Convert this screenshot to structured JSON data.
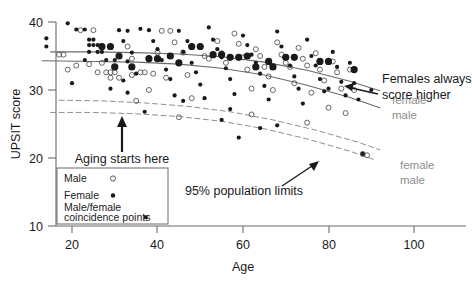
{
  "figure": {
    "background": "#ffffff",
    "axis_color": "#6b6b6b",
    "point_color": "#1a1a1a",
    "curve_color": "#6b6b6b",
    "label_gray": "#8e8e8e"
  },
  "axes": {
    "x": {
      "label": "Age",
      "ticks": [
        20,
        40,
        60,
        80,
        100
      ],
      "tick_labels": [
        "20",
        "40",
        "60",
        "80",
        "100"
      ],
      "min": 10,
      "max": 104
    },
    "y": {
      "label": "UPSIT score",
      "ticks": [
        10,
        20,
        30,
        40
      ],
      "tick_labels": [
        "10",
        "20",
        "30",
        "40"
      ],
      "min": 9,
      "max": 41
    }
  },
  "annotations": [
    {
      "name": "females-higher",
      "lines": [
        "Females always",
        "score higher"
      ]
    },
    {
      "name": "aging-starts",
      "lines": [
        "Aging starts here"
      ]
    },
    {
      "name": "population-limits",
      "lines": [
        "95% population limits"
      ]
    }
  ],
  "curve_labels": [
    {
      "name": "regression-female",
      "text": "female"
    },
    {
      "name": "regression-male",
      "text": "male"
    },
    {
      "name": "limit-female",
      "text": "female"
    },
    {
      "name": "limit-male",
      "text": "male"
    }
  ],
  "legend": {
    "items": [
      {
        "label": "Male",
        "marker": "open-circle"
      },
      {
        "label": "Female",
        "marker": "filled-dot"
      },
      {
        "label": "Male/female",
        "label2": "coincidence points",
        "marker": "small-square"
      }
    ]
  },
  "chart_data": {
    "type": "scatter",
    "title": "",
    "xlabel": "Age",
    "ylabel": "UPSIT score",
    "xlim": [
      10,
      104
    ],
    "ylim": [
      9,
      41
    ],
    "grid": false,
    "legend_position": "lower-left",
    "series": [
      {
        "name": "Male",
        "marker": "open-circle",
        "points": [
          [
            17,
            35.2
          ],
          [
            18,
            35.2
          ],
          [
            22,
            38.8
          ],
          [
            25,
            38.8
          ],
          [
            26,
            32.6
          ],
          [
            28,
            32.6
          ],
          [
            29,
            32.6
          ],
          [
            30,
            32.6
          ],
          [
            29,
            31.8
          ],
          [
            31,
            31.8
          ],
          [
            33,
            36.4
          ],
          [
            34,
            34.6
          ],
          [
            36,
            32.6
          ],
          [
            37,
            32.6
          ],
          [
            38,
            30.0
          ],
          [
            40,
            35.5
          ],
          [
            41,
            38.7
          ],
          [
            43,
            38.7
          ],
          [
            44,
            37.0
          ],
          [
            46,
            35.5
          ],
          [
            47,
            32.2
          ],
          [
            48,
            28.8
          ],
          [
            50,
            36.4
          ],
          [
            51,
            35.0
          ],
          [
            52,
            34.6
          ],
          [
            54,
            37.2
          ],
          [
            55,
            35.4
          ],
          [
            56,
            34.0
          ],
          [
            58,
            38.3
          ],
          [
            59,
            36.8
          ],
          [
            60,
            34.8
          ],
          [
            61,
            33.0
          ],
          [
            62,
            30.2
          ],
          [
            63,
            36.0
          ],
          [
            64,
            35.0
          ],
          [
            65,
            33.4
          ],
          [
            66,
            32.0
          ],
          [
            67,
            30.0
          ],
          [
            68,
            37.0
          ],
          [
            69,
            35.2
          ],
          [
            70,
            34.0
          ],
          [
            71,
            33.4
          ],
          [
            72,
            31.0
          ],
          [
            73,
            36.2
          ],
          [
            74,
            34.6
          ],
          [
            75,
            33.6
          ],
          [
            76,
            29.6
          ],
          [
            77,
            35.4
          ],
          [
            78,
            33.0
          ],
          [
            79,
            31.4
          ],
          [
            80,
            27.4
          ],
          [
            81,
            34.2
          ],
          [
            82,
            32.6
          ],
          [
            83,
            30.2
          ],
          [
            84,
            26.6
          ],
          [
            85,
            33.0
          ],
          [
            86,
            30.0
          ],
          [
            88,
            20.6
          ],
          [
            89,
            20.4
          ],
          [
            35,
            28.4
          ],
          [
            45,
            26.0
          ],
          [
            62,
            26.4
          ],
          [
            75,
            25.2
          ],
          [
            24,
            33.8
          ],
          [
            27,
            34.0
          ],
          [
            21,
            33.6
          ],
          [
            19,
            33.0
          ],
          [
            34,
            32.2
          ],
          [
            39,
            32.4
          ],
          [
            42,
            31.8
          ]
        ]
      },
      {
        "name": "Female",
        "marker": "filled-dot",
        "points": [
          [
            14,
            37.6
          ],
          [
            14,
            36.4
          ],
          [
            19,
            39.8
          ],
          [
            21,
            38.9
          ],
          [
            23,
            38.9
          ],
          [
            24,
            37.4
          ],
          [
            25,
            37.4
          ],
          [
            24,
            36.6
          ],
          [
            25,
            36.6
          ],
          [
            26,
            36.6
          ],
          [
            24,
            35.6
          ],
          [
            26,
            35.6
          ],
          [
            27,
            35.6
          ],
          [
            23,
            34.4
          ],
          [
            28,
            34.4
          ],
          [
            30,
            34.4
          ],
          [
            31,
            38.8
          ],
          [
            33,
            38.7
          ],
          [
            32,
            37.2
          ],
          [
            34,
            35.5
          ],
          [
            33,
            34.2
          ],
          [
            35,
            32.4
          ],
          [
            32,
            31.4
          ],
          [
            36,
            39.0
          ],
          [
            38,
            38.8
          ],
          [
            39,
            37.2
          ],
          [
            40,
            36.0
          ],
          [
            41,
            34.4
          ],
          [
            42,
            33.0
          ],
          [
            43,
            31.6
          ],
          [
            45,
            38.7
          ],
          [
            47,
            37.2
          ],
          [
            46,
            35.6
          ],
          [
            48,
            34.0
          ],
          [
            49,
            32.6
          ],
          [
            50,
            30.8
          ],
          [
            52,
            39.2
          ],
          [
            53,
            37.4
          ],
          [
            54,
            36.0
          ],
          [
            55,
            34.8
          ],
          [
            56,
            33.2
          ],
          [
            57,
            31.6
          ],
          [
            58,
            29.4
          ],
          [
            60,
            38.0
          ],
          [
            61,
            36.6
          ],
          [
            62,
            35.2
          ],
          [
            63,
            34.0
          ],
          [
            64,
            32.4
          ],
          [
            65,
            30.6
          ],
          [
            66,
            28.6
          ],
          [
            68,
            38.6
          ],
          [
            69,
            36.4
          ],
          [
            70,
            35.0
          ],
          [
            71,
            33.6
          ],
          [
            72,
            32.0
          ],
          [
            73,
            30.2
          ],
          [
            75,
            37.4
          ],
          [
            76,
            35.0
          ],
          [
            77,
            33.6
          ],
          [
            78,
            31.6
          ],
          [
            79,
            29.8
          ],
          [
            81,
            35.6
          ],
          [
            82,
            33.4
          ],
          [
            83,
            31.2
          ],
          [
            85,
            34.0
          ],
          [
            86,
            31.0
          ],
          [
            87,
            28.6
          ],
          [
            88,
            20.6
          ],
          [
            37,
            26.8
          ],
          [
            55,
            25.6
          ],
          [
            64,
            24.4
          ],
          [
            68,
            24.8
          ],
          [
            59,
            23.0
          ],
          [
            33,
            29.6
          ],
          [
            44,
            29.2
          ],
          [
            51,
            28.8
          ],
          [
            29,
            30.2
          ],
          [
            20,
            31.0
          ],
          [
            80,
            30.2
          ],
          [
            74,
            28.0
          ],
          [
            84,
            29.2
          ],
          [
            90,
            30.0
          ],
          [
            46,
            28.4
          ],
          [
            57,
            27.2
          ]
        ]
      },
      {
        "name": "Male/female coincidence points",
        "marker": "small-square",
        "points": [
          [
            27,
            36.4
          ],
          [
            29,
            36.4
          ],
          [
            31,
            35.0
          ],
          [
            43,
            35.0
          ],
          [
            48,
            36.4
          ],
          [
            50,
            36.4
          ],
          [
            53,
            35.2
          ],
          [
            55,
            35.2
          ],
          [
            57,
            34.8
          ],
          [
            59,
            34.8
          ],
          [
            61,
            35.0
          ],
          [
            66,
            34.2
          ],
          [
            70,
            34.8
          ],
          [
            72,
            34.8
          ],
          [
            38,
            34.6
          ],
          [
            40,
            34.6
          ],
          [
            45,
            34.0
          ],
          [
            63,
            33.4
          ],
          [
            67,
            33.4
          ],
          [
            78,
            34.2
          ],
          [
            80,
            34.2
          ],
          [
            86,
            33.0
          ],
          [
            30,
            33.4
          ],
          [
            34,
            33.4
          ]
        ]
      }
    ],
    "curves": [
      {
        "name": "female-mean",
        "style": "solid",
        "color": "#6b6b6b",
        "points": [
          [
            15,
            35.6
          ],
          [
            25,
            35.6
          ],
          [
            35,
            35.5
          ],
          [
            45,
            35.3
          ],
          [
            55,
            34.9
          ],
          [
            65,
            34.1
          ],
          [
            75,
            32.9
          ],
          [
            85,
            31.3
          ],
          [
            92,
            29.9
          ]
        ]
      },
      {
        "name": "male-mean",
        "style": "solid",
        "color": "#6b6b6b",
        "points": [
          [
            13,
            34.3
          ],
          [
            25,
            34.2
          ],
          [
            35,
            34.1
          ],
          [
            45,
            33.8
          ],
          [
            55,
            33.2
          ],
          [
            65,
            32.2
          ],
          [
            75,
            30.7
          ],
          [
            85,
            28.9
          ],
          [
            92,
            27.4
          ]
        ]
      },
      {
        "name": "female-95-limit",
        "style": "dashed",
        "color": "#8e8e8e",
        "points": [
          [
            17,
            28.5
          ],
          [
            27,
            28.4
          ],
          [
            37,
            28.1
          ],
          [
            47,
            27.6
          ],
          [
            57,
            26.8
          ],
          [
            67,
            25.6
          ],
          [
            77,
            24.1
          ],
          [
            87,
            22.3
          ],
          [
            92,
            21.2
          ]
        ]
      },
      {
        "name": "male-95-limit",
        "style": "dashed",
        "color": "#8e8e8e",
        "points": [
          [
            15,
            26.7
          ],
          [
            25,
            26.7
          ],
          [
            35,
            26.5
          ],
          [
            45,
            26.1
          ],
          [
            55,
            25.4
          ],
          [
            65,
            24.3
          ],
          [
            75,
            22.8
          ],
          [
            85,
            21.0
          ],
          [
            91,
            19.7
          ]
        ]
      }
    ],
    "annotations": [
      {
        "text": "Females always score higher",
        "points_to": [
          84,
          31.5
        ]
      },
      {
        "text": "Aging starts here",
        "points_to": [
          33,
          26.6
        ]
      },
      {
        "text": "95% population limits",
        "points_to": [
          80,
          22.6
        ]
      }
    ]
  }
}
